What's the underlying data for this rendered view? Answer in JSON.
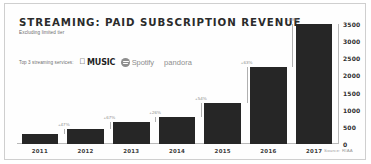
{
  "header": {
    "title": "STREAMING: PAID SUBSCRIPTION REVENUE",
    "subtitle": "Excluding limited tier"
  },
  "services": {
    "label": "Top 3 streaming services:",
    "items": [
      {
        "name": "apple-music",
        "icon": "apple-icon",
        "glyph": "",
        "text": "MUSIC"
      },
      {
        "name": "spotify",
        "icon": "spotify-icon",
        "text": "Spotify"
      },
      {
        "name": "pandora",
        "text": "pandora"
      }
    ]
  },
  "footer": {
    "source": "Source: RIAA"
  },
  "chart_data": {
    "type": "bar",
    "title": "STREAMING: PAID SUBSCRIPTION REVENUE",
    "subtitle": "Excluding limited tier",
    "xlabel": "",
    "ylabel": "",
    "categories": [
      "2011",
      "2012",
      "2013",
      "2014",
      "2015",
      "2016",
      "2017"
    ],
    "values": [
      300,
      450,
      650,
      800,
      1200,
      2250,
      3500
    ],
    "ylim": [
      0,
      3500
    ],
    "yticks": [
      0,
      500,
      1000,
      1500,
      2000,
      2500,
      3000,
      3500
    ],
    "ytick_labels": [
      "0",
      "500",
      "1000",
      "1500",
      "2000",
      "2500",
      "3000",
      "3500"
    ],
    "grid": false,
    "legend_position": "top-left",
    "bar_color": "#262626",
    "annotations": [
      {
        "after_category": "2011",
        "label": "+47%",
        "value": 47
      },
      {
        "after_category": "2012",
        "label": "+67%",
        "value": 67
      },
      {
        "after_category": "2013",
        "label": "+26%",
        "value": 26
      },
      {
        "after_category": "2014",
        "label": "+54%",
        "value": 54
      },
      {
        "after_category": "2015",
        "label": "+63%",
        "value": 63
      },
      {
        "after_category": "2016",
        "label": "+59%",
        "value": 59
      }
    ],
    "source": "Source: RIAA"
  }
}
